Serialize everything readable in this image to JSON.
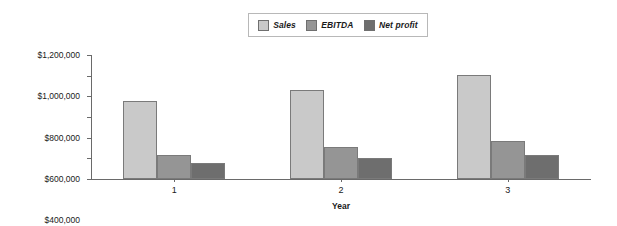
{
  "chart_data": {
    "type": "bar",
    "title": "",
    "subtitle": "",
    "xlabel": "Year",
    "ylabel": "",
    "categories": [
      "1",
      "2",
      "3"
    ],
    "series": [
      {
        "name": "Sales",
        "color": "#c9c9c9",
        "values": [
          755000,
          861000,
          1006000
        ]
      },
      {
        "name": "EBITDA",
        "color": "#959595",
        "values": [
          232000,
          310000,
          368000
        ]
      },
      {
        "name": "Net profit",
        "color": "#6e6e6e",
        "values": [
          155000,
          203000,
          232000
        ]
      }
    ],
    "ylim": [
      0,
      1200000
    ],
    "ytick_values": [
      0,
      200000,
      400000,
      600000,
      800000,
      1000000,
      1200000
    ],
    "ytick_labels": [
      "$0",
      "$200,000",
      "$400,000",
      "$600,000",
      "$800,000",
      "$1,000,000",
      "$1,200,000"
    ],
    "grid": false,
    "legend_position": "top-center",
    "legend_entries": [
      "Sales",
      "EBITDA",
      "Net profit"
    ],
    "annotations": []
  }
}
